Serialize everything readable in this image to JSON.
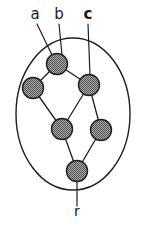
{
  "figure": {
    "width": 148,
    "height": 229,
    "background_color": "#ffffff",
    "ink_color": "#1f1f1f"
  },
  "boundary": {
    "shape": "ellipse",
    "cx": 73,
    "cy": 114,
    "rx": 57,
    "ry": 76,
    "stroke_color": "#1f1f1f",
    "stroke_width": 1.4,
    "fill": "none"
  },
  "node_style": {
    "radius": 10.5,
    "stroke_color": "#1f1f1f",
    "stroke_width": 1.4,
    "fill_pattern": "checkered-gray",
    "fill_base_color": "#9a9a9a",
    "fill_dot_color": "#4a4a4a"
  },
  "edge_style": {
    "stroke_color": "#1f1f1f",
    "stroke_width": 1.3
  },
  "leader_style": {
    "stroke_color": "#1f1f1f",
    "stroke_width": 1.2
  },
  "nodes": [
    {
      "id": "n1",
      "cx": 57,
      "cy": 64
    },
    {
      "id": "n2",
      "cx": 33,
      "cy": 88
    },
    {
      "id": "n3",
      "cx": 89,
      "cy": 85
    },
    {
      "id": "n4",
      "cx": 62,
      "cy": 129
    },
    {
      "id": "n5",
      "cx": 101,
      "cy": 130
    },
    {
      "id": "n6",
      "cx": 77,
      "cy": 171
    }
  ],
  "edges": [
    {
      "from": "n1",
      "to": "n2"
    },
    {
      "from": "n1",
      "to": "n3"
    },
    {
      "from": "n2",
      "to": "n4"
    },
    {
      "from": "n3",
      "to": "n4"
    },
    {
      "from": "n3",
      "to": "n5"
    },
    {
      "from": "n4",
      "to": "n6"
    },
    {
      "from": "n5",
      "to": "n6"
    }
  ],
  "labels": [
    {
      "id": "label-a",
      "text": "a",
      "weight": "normal",
      "x": 35,
      "y": 19,
      "leader": {
        "x1": 37,
        "y1": 24,
        "x2": 52,
        "y2": 55
      },
      "target_node": "n1"
    },
    {
      "id": "label-b",
      "text": "b",
      "weight": "normal",
      "x": 59,
      "y": 19,
      "leader": {
        "x1": 59,
        "y1": 24,
        "x2": 62,
        "y2": 55
      },
      "target_node": "n1"
    },
    {
      "id": "label-c",
      "text": "c",
      "weight": "bold",
      "x": 88,
      "y": 19,
      "leader": {
        "x1": 88,
        "y1": 24,
        "x2": 90,
        "y2": 75
      },
      "target_node": "n3"
    },
    {
      "id": "label-r",
      "text": "r",
      "weight": "normal",
      "x": 77,
      "y": 216,
      "leader": {
        "x1": 77,
        "y1": 181,
        "x2": 77,
        "y2": 206
      },
      "target_node": "n6"
    }
  ],
  "label_font_size": 15,
  "root_label_font_size": 14
}
